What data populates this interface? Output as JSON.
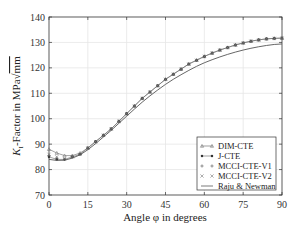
{
  "chart_data": {
    "type": "line",
    "title": "",
    "xlabel": "Angle φ in degrees",
    "ylabel": "K_I-Factor in MPa√mm",
    "ylabel_parts": {
      "main": "K",
      "sub": "I",
      "rest": "-Factor in MPa",
      "sqrt": "mm"
    },
    "xlim": [
      0,
      90
    ],
    "ylim": [
      70,
      140
    ],
    "xticks": [
      0,
      15,
      30,
      45,
      60,
      75,
      90
    ],
    "yticks": [
      70,
      80,
      90,
      100,
      110,
      120,
      130,
      140
    ],
    "grid": true,
    "legend_position": "lower right",
    "x": [
      0,
      3,
      6,
      9,
      12,
      15,
      18,
      21,
      24,
      27,
      30,
      33,
      36,
      39,
      42,
      45,
      48,
      51,
      54,
      57,
      60,
      63,
      66,
      69,
      72,
      75,
      78,
      81,
      84,
      87,
      90
    ],
    "series": [
      {
        "name": "DIM-CTE",
        "marker": "triangle",
        "line": true,
        "values": [
          88,
          86.5,
          85.5,
          85.5,
          86.5,
          88.5,
          91,
          93.5,
          96,
          99,
          102,
          105,
          108,
          110.5,
          113,
          115.5,
          117.5,
          119.5,
          121.5,
          123,
          124.5,
          125.8,
          127,
          128,
          129,
          129.8,
          130.5,
          131,
          131.4,
          131.6,
          131.7
        ]
      },
      {
        "name": "J-CTE",
        "marker": "circle",
        "line": true,
        "values": [
          85,
          84,
          84,
          85,
          86,
          88.5,
          91,
          93.5,
          96,
          99,
          102,
          105,
          108,
          110.5,
          113,
          115.5,
          117.5,
          119.5,
          121.5,
          123,
          124.5,
          125.8,
          127,
          128,
          129,
          129.8,
          130.5,
          131,
          131.4,
          131.6,
          131.7
        ]
      },
      {
        "name": "MCCI-CTE-V1",
        "marker": "plus",
        "line": false,
        "values": [
          85.5,
          84.5,
          84,
          85,
          86,
          88.5,
          91,
          93.5,
          96,
          99,
          102,
          105,
          108,
          110.5,
          113,
          115.5,
          117.5,
          119.5,
          121.5,
          123,
          124.5,
          125.8,
          127,
          128,
          129,
          129.8,
          130.5,
          131,
          131.4,
          131.6,
          131.7
        ]
      },
      {
        "name": "MCCI-CTE-V2",
        "marker": "cross",
        "line": false,
        "values": [
          86,
          85,
          84.3,
          85,
          86,
          88.5,
          91,
          93.5,
          96,
          99,
          102,
          105,
          108,
          110.5,
          113,
          115.5,
          117.5,
          119.5,
          121.5,
          123,
          124.5,
          125.8,
          127,
          128,
          129,
          129.8,
          130.5,
          131,
          131.4,
          131.6,
          131.7
        ]
      },
      {
        "name": "Raju & Newman",
        "marker": "none",
        "line": true,
        "values": [
          84,
          83.6,
          83.7,
          84.5,
          85.8,
          87.8,
          90.2,
          92.8,
          95.4,
          98.2,
          101,
          103.8,
          106.5,
          109,
          111.3,
          113.5,
          115.5,
          117.3,
          119,
          120.6,
          122,
          123.2,
          124.3,
          125.3,
          126.2,
          127,
          127.7,
          128.3,
          128.8,
          129.2,
          129.4
        ]
      }
    ],
    "colors": {
      "markers": "#444444",
      "raju_line": "#555555",
      "grid": "#e6e6e6",
      "axis": "#333333"
    }
  }
}
